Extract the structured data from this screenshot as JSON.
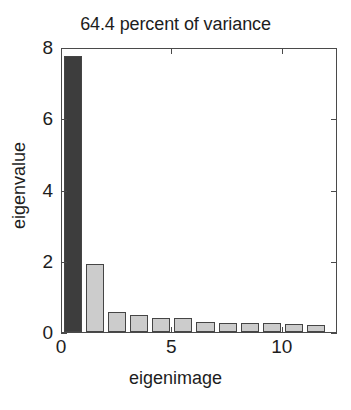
{
  "chart_data": {
    "type": "bar",
    "title": "64.4 percent of variance",
    "xlabel": "eigenimage",
    "ylabel": "eigenvalue",
    "categories": [
      1,
      2,
      3,
      4,
      5,
      6,
      7,
      8,
      9,
      10,
      11,
      12
    ],
    "values": [
      7.75,
      1.91,
      0.56,
      0.48,
      0.39,
      0.38,
      0.28,
      0.26,
      0.25,
      0.24,
      0.22,
      0.21
    ],
    "bar_colors": [
      "#3d3d3d",
      "#cccccc",
      "#cccccc",
      "#cccccc",
      "#cccccc",
      "#cccccc",
      "#cccccc",
      "#cccccc",
      "#cccccc",
      "#cccccc",
      "#cccccc",
      "#cccccc"
    ],
    "bar_edge_color": "#454545",
    "highlight_color": "#3d3d3d",
    "default_bar_color": "#cccccc",
    "xlim": [
      0,
      12.5
    ],
    "ylim": [
      0,
      8
    ],
    "yticks": [
      0,
      2,
      4,
      6,
      8
    ],
    "ytick_labels": [
      "0",
      "2",
      "4",
      "6",
      "8"
    ],
    "xticks": [
      0,
      5,
      10
    ],
    "xtick_labels": [
      "0",
      "5",
      "10"
    ],
    "grid": false,
    "legend": null
  }
}
